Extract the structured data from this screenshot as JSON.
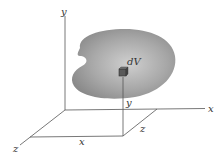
{
  "diagram": {
    "axes": {
      "y_label": "y",
      "x_label": "x",
      "z_label": "z"
    },
    "element": {
      "label": "dV"
    },
    "dimensions": {
      "x_label": "x",
      "y_label": "y",
      "z_label": "z"
    },
    "colors": {
      "body_fill": "#9a9a9a",
      "body_highlight": "#c8c8c8",
      "lines": "#555555",
      "element": "#5a5a5a"
    }
  }
}
